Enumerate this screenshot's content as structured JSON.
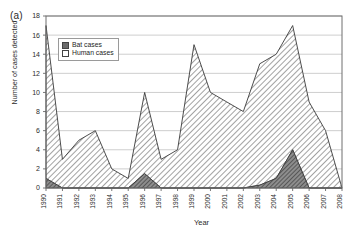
{
  "panel": {
    "label": "(a)"
  },
  "legend": {
    "items": [
      {
        "name": "bat-cases",
        "label": "Bat cases",
        "style": "filled",
        "color": "#6b6b6b"
      },
      {
        "name": "human-cases",
        "label": "Human cases",
        "style": "hollow",
        "color": "#ffffff"
      }
    ]
  },
  "chart_data": {
    "type": "area",
    "title": "",
    "xlabel": "Year",
    "ylabel": "Number of cases detected",
    "categories": [
      1990,
      1991,
      1992,
      1993,
      1994,
      1995,
      1996,
      1997,
      1998,
      1999,
      2000,
      2001,
      2002,
      2003,
      2004,
      2005,
      2006,
      2007,
      2008
    ],
    "tick_labels": [
      "1990",
      "1991",
      "1992",
      "1993",
      "1994",
      "1995",
      "1996",
      "1997",
      "1998",
      "1999",
      "2000",
      "2001",
      "2002",
      "2003",
      "2004",
      "2005",
      "2006",
      "2007",
      "2008"
    ],
    "ylim": [
      0,
      18
    ],
    "yticks": [
      0,
      2,
      4,
      6,
      8,
      10,
      12,
      14,
      16,
      18
    ],
    "xlim": [
      1990,
      2008
    ],
    "grid": true,
    "grid_axis": "y",
    "legend_position": "upper-left-inside",
    "stacked": true,
    "series": [
      {
        "name": "Bat cases",
        "key": "bat",
        "fill": "#6b6b6b",
        "values": [
          1,
          0,
          0,
          0,
          0,
          0,
          1.5,
          0,
          0,
          0,
          0,
          0,
          0,
          0.3,
          1,
          4,
          0,
          0,
          0
        ]
      },
      {
        "name": "Human cases",
        "key": "human",
        "fill": "#ffffff",
        "values": [
          16,
          3,
          5,
          6,
          2,
          1,
          8.5,
          3,
          4,
          15,
          10,
          9,
          8,
          12.7,
          13,
          13,
          9,
          6,
          0
        ]
      }
    ],
    "totals": [
      17,
      3,
      5,
      6,
      2,
      1,
      10,
      3,
      4,
      15,
      10,
      9,
      8,
      13,
      14,
      17,
      9,
      6,
      0
    ]
  }
}
